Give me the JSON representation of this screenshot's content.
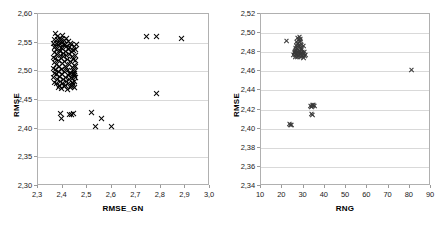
{
  "figure": {
    "decimal_separator": ",",
    "marker_symbol": "x",
    "marker_color": "#000000",
    "grid_color": "#d9d9d9",
    "frame_color": "#b0b0b0"
  },
  "chart_data": [
    {
      "id": "left",
      "type": "scatter",
      "title": "",
      "xlabel": "RMSE_GN",
      "ylabel": "RMSE",
      "xlim": [
        2.3,
        3.0
      ],
      "ylim": [
        2.3,
        2.6
      ],
      "xticks": [
        2.3,
        2.4,
        2.5,
        2.6,
        2.7,
        2.8,
        2.9,
        3.0
      ],
      "xticklabels": [
        "2,3",
        "2,4",
        "2,5",
        "2,6",
        "2,7",
        "2,8",
        "2,9",
        "3,0"
      ],
      "yticks": [
        2.3,
        2.35,
        2.4,
        2.45,
        2.5,
        2.55,
        2.6
      ],
      "yticklabels": [
        "2,30",
        "2,35",
        "2,40",
        "2,45",
        "2,50",
        "2,55",
        "2,60"
      ],
      "grid": "horizontal",
      "legend": "none",
      "points": [
        [
          2.372,
          2.566
        ],
        [
          2.381,
          2.561
        ],
        [
          2.392,
          2.558
        ],
        [
          2.402,
          2.562
        ],
        [
          2.386,
          2.552
        ],
        [
          2.396,
          2.556
        ],
        [
          2.408,
          2.553
        ],
        [
          2.418,
          2.557
        ],
        [
          2.377,
          2.548
        ],
        [
          2.389,
          2.549
        ],
        [
          2.399,
          2.551
        ],
        [
          2.411,
          2.547
        ],
        [
          2.423,
          2.552
        ],
        [
          2.432,
          2.549
        ],
        [
          2.37,
          2.543
        ],
        [
          2.382,
          2.545
        ],
        [
          2.394,
          2.541
        ],
        [
          2.405,
          2.546
        ],
        [
          2.416,
          2.544
        ],
        [
          2.428,
          2.542
        ],
        [
          2.438,
          2.547
        ],
        [
          2.447,
          2.543
        ],
        [
          2.374,
          2.538
        ],
        [
          2.387,
          2.536
        ],
        [
          2.399,
          2.539
        ],
        [
          2.412,
          2.535
        ],
        [
          2.424,
          2.538
        ],
        [
          2.436,
          2.534
        ],
        [
          2.443,
          2.537
        ],
        [
          2.378,
          2.53
        ],
        [
          2.391,
          2.528
        ],
        [
          2.404,
          2.531
        ],
        [
          2.417,
          2.527
        ],
        [
          2.429,
          2.53
        ],
        [
          2.441,
          2.526
        ],
        [
          2.372,
          2.522
        ],
        [
          2.385,
          2.519
        ],
        [
          2.398,
          2.523
        ],
        [
          2.41,
          2.518
        ],
        [
          2.422,
          2.521
        ],
        [
          2.434,
          2.517
        ],
        [
          2.446,
          2.52
        ],
        [
          2.376,
          2.512
        ],
        [
          2.389,
          2.509
        ],
        [
          2.402,
          2.513
        ],
        [
          2.414,
          2.508
        ],
        [
          2.427,
          2.512
        ],
        [
          2.439,
          2.507
        ],
        [
          2.449,
          2.511
        ],
        [
          2.371,
          2.503
        ],
        [
          2.384,
          2.5
        ],
        [
          2.397,
          2.504
        ],
        [
          2.409,
          2.499
        ],
        [
          2.421,
          2.502
        ],
        [
          2.433,
          2.498
        ],
        [
          2.444,
          2.501
        ],
        [
          2.375,
          2.494
        ],
        [
          2.388,
          2.491
        ],
        [
          2.4,
          2.495
        ],
        [
          2.413,
          2.49
        ],
        [
          2.425,
          2.493
        ],
        [
          2.437,
          2.489
        ],
        [
          2.448,
          2.492
        ],
        [
          2.379,
          2.485
        ],
        [
          2.392,
          2.483
        ],
        [
          2.404,
          2.486
        ],
        [
          2.416,
          2.482
        ],
        [
          2.428,
          2.485
        ],
        [
          2.44,
          2.481
        ],
        [
          2.45,
          2.496
        ],
        [
          2.374,
          2.478
        ],
        [
          2.387,
          2.476
        ],
        [
          2.399,
          2.479
        ],
        [
          2.411,
          2.475
        ],
        [
          2.423,
          2.478
        ],
        [
          2.435,
          2.474
        ],
        [
          2.446,
          2.477
        ],
        [
          2.383,
          2.472
        ],
        [
          2.395,
          2.47
        ],
        [
          2.407,
          2.473
        ],
        [
          2.419,
          2.469
        ],
        [
          2.431,
          2.472
        ],
        [
          2.442,
          2.475
        ],
        [
          2.38,
          2.555
        ],
        [
          2.393,
          2.534
        ],
        [
          2.406,
          2.526
        ],
        [
          2.418,
          2.506
        ],
        [
          2.43,
          2.497
        ],
        [
          2.441,
          2.488
        ],
        [
          2.368,
          2.556
        ],
        [
          2.363,
          2.549
        ],
        [
          2.366,
          2.541
        ],
        [
          2.369,
          2.533
        ],
        [
          2.364,
          2.524
        ],
        [
          2.367,
          2.515
        ],
        [
          2.365,
          2.505
        ],
        [
          2.368,
          2.497
        ],
        [
          2.363,
          2.489
        ],
        [
          2.366,
          2.481
        ],
        [
          2.452,
          2.538
        ],
        [
          2.455,
          2.528
        ],
        [
          2.451,
          2.519
        ],
        [
          2.454,
          2.509
        ],
        [
          2.45,
          2.5
        ],
        [
          2.453,
          2.49
        ],
        [
          2.449,
          2.483
        ],
        [
          2.456,
          2.546
        ],
        [
          2.443,
          2.497
        ],
        [
          2.447,
          2.472
        ],
        [
          2.741,
          2.561
        ],
        [
          2.783,
          2.561
        ],
        [
          2.884,
          2.557
        ],
        [
          2.781,
          2.462
        ],
        [
          2.392,
          2.427
        ],
        [
          2.396,
          2.417
        ],
        [
          2.428,
          2.425
        ],
        [
          2.436,
          2.425
        ],
        [
          2.445,
          2.426
        ],
        [
          2.52,
          2.428
        ],
        [
          2.536,
          2.404
        ],
        [
          2.559,
          2.418
        ],
        [
          2.598,
          2.403
        ]
      ]
    },
    {
      "id": "right",
      "type": "scatter",
      "title": "",
      "xlabel": "RNG",
      "ylabel": "RMSE",
      "xlim": [
        10,
        90
      ],
      "ylim": [
        2.34,
        2.52
      ],
      "xticks": [
        10,
        20,
        30,
        40,
        50,
        60,
        70,
        80,
        90
      ],
      "xticklabels": [
        "10",
        "20",
        "30",
        "40",
        "50",
        "60",
        "70",
        "80",
        "90"
      ],
      "yticks": [
        2.34,
        2.36,
        2.38,
        2.4,
        2.42,
        2.44,
        2.46,
        2.48,
        2.5,
        2.52
      ],
      "yticklabels": [
        "2,34",
        "2,36",
        "2,38",
        "2,40",
        "2,42",
        "2,44",
        "2,46",
        "2,48",
        "2,50",
        "2,52"
      ],
      "grid": "horizontal",
      "legend": "none",
      "points": [
        [
          22.1,
          2.492
        ],
        [
          27.2,
          2.4955
        ],
        [
          27.9,
          2.496
        ],
        [
          28.4,
          2.494
        ],
        [
          27.5,
          2.493
        ],
        [
          28.1,
          2.491
        ],
        [
          26.9,
          2.4905
        ],
        [
          28.7,
          2.4925
        ],
        [
          27.0,
          2.4885
        ],
        [
          28.2,
          2.488
        ],
        [
          26.6,
          2.487
        ],
        [
          27.7,
          2.4865
        ],
        [
          28.9,
          2.4875
        ],
        [
          26.3,
          2.4845
        ],
        [
          27.3,
          2.484
        ],
        [
          28.5,
          2.485
        ],
        [
          29.2,
          2.4835
        ],
        [
          26.8,
          2.482
        ],
        [
          27.9,
          2.4815
        ],
        [
          29.0,
          2.4825
        ],
        [
          26.1,
          2.4805
        ],
        [
          27.1,
          2.48
        ],
        [
          28.3,
          2.4795
        ],
        [
          29.4,
          2.4805
        ],
        [
          25.9,
          2.479
        ],
        [
          26.9,
          2.4785
        ],
        [
          28.0,
          2.478
        ],
        [
          29.1,
          2.479
        ],
        [
          30.0,
          2.4785
        ],
        [
          26.4,
          2.477
        ],
        [
          27.5,
          2.4765
        ],
        [
          28.6,
          2.477
        ],
        [
          29.6,
          2.476
        ],
        [
          26.0,
          2.4755
        ],
        [
          27.2,
          2.475
        ],
        [
          28.4,
          2.4755
        ],
        [
          29.8,
          2.4745
        ],
        [
          30.6,
          2.476
        ],
        [
          25.6,
          2.48
        ],
        [
          26.2,
          2.483
        ],
        [
          29.9,
          2.4865
        ],
        [
          30.3,
          2.481
        ],
        [
          25.4,
          2.4775
        ],
        [
          30.9,
          2.4775
        ],
        [
          81.0,
          2.462
        ],
        [
          33.2,
          2.4245
        ],
        [
          34.0,
          2.4255
        ],
        [
          34.7,
          2.425
        ],
        [
          35.2,
          2.424
        ],
        [
          33.7,
          2.423
        ],
        [
          34.3,
          2.4235
        ],
        [
          33.9,
          2.4155
        ],
        [
          34.1,
          2.4148
        ],
        [
          23.6,
          2.405
        ],
        [
          24.4,
          2.4045
        ],
        [
          24.0,
          2.404
        ]
      ]
    }
  ]
}
